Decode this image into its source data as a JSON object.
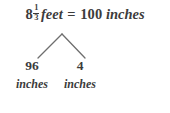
{
  "diagram": {
    "type": "number-bond",
    "background_color": "#ffffff",
    "text_color": "#3c3c3c",
    "equation": {
      "whole_number": "8",
      "fraction_numerator": "1",
      "fraction_denominator": "3",
      "left_unit": "feet",
      "operator": "=",
      "right_value": "100",
      "right_unit": "inches"
    },
    "children": [
      {
        "value": "96",
        "unit": "inches"
      },
      {
        "value": "4",
        "unit": "inches"
      }
    ]
  }
}
